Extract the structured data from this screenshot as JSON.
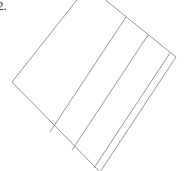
{
  "page": {
    "background_color": "#ffffff",
    "width": 187,
    "height": 171
  },
  "problem": {
    "number_label": "2."
  },
  "figure": {
    "name": "divided-rotated-rectangle",
    "stroke_color": "#8a8a8a",
    "fill_color": "none",
    "stroke_width": 0.9,
    "rotation_degrees": -39,
    "strip_count": 4,
    "internal_line_count": 3,
    "outline_points": "88,-14 176,57 100,172 12,82",
    "internal_lines": [
      {
        "name": "divider-1",
        "x1": 126,
        "y1": 17,
        "x2": 50,
        "y2": 132
      },
      {
        "name": "divider-2",
        "x1": 148,
        "y1": 35,
        "x2": 72,
        "y2": 150
      },
      {
        "name": "divider-3",
        "x1": 170,
        "y1": 53,
        "x2": 94,
        "y2": 168
      }
    ]
  }
}
